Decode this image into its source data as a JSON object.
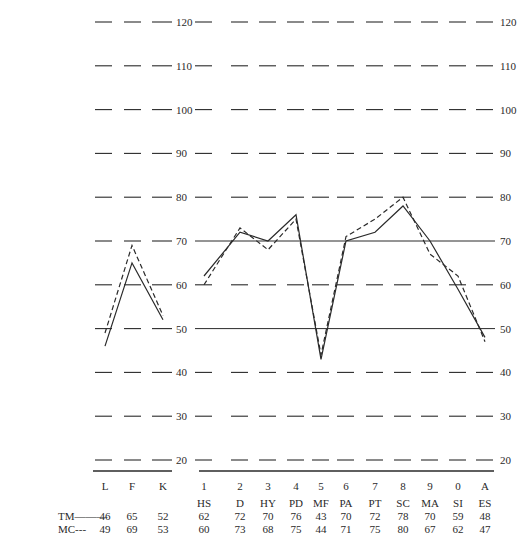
{
  "chart_data": {
    "type": "line",
    "title": "",
    "xlabel": "",
    "ylabel": "",
    "ylim": [
      20,
      120
    ],
    "y_ticks": [
      20,
      30,
      40,
      50,
      60,
      70,
      80,
      90,
      100,
      110,
      120
    ],
    "grid": "dashed horizontal, solid at 50 and 70 on clinical scales",
    "groups": [
      {
        "name": "validity",
        "categories": [
          "L",
          "F",
          "K"
        ],
        "series": [
          {
            "name": "TM",
            "style": "solid",
            "values": [
              46,
              65,
              52
            ]
          },
          {
            "name": "MC",
            "style": "dashed",
            "values": [
              49,
              69,
              53
            ]
          }
        ]
      },
      {
        "name": "clinical",
        "categories": [
          "1",
          "2",
          "3",
          "4",
          "5",
          "6",
          "7",
          "8",
          "9",
          "0",
          "A"
        ],
        "scale_names": [
          "HS",
          "D",
          "HY",
          "PD",
          "MF",
          "PA",
          "PT",
          "SC",
          "MA",
          "SI",
          "ES"
        ],
        "series": [
          {
            "name": "TM",
            "style": "solid",
            "values": [
              62,
              72,
              70,
              76,
              43,
              70,
              72,
              78,
              70,
              59,
              48
            ]
          },
          {
            "name": "MC",
            "style": "dashed",
            "values": [
              60,
              73,
              68,
              75,
              44,
              71,
              75,
              80,
              67,
              62,
              47
            ]
          }
        ]
      }
    ],
    "legend": [
      {
        "label": "TM———",
        "style": "solid"
      },
      {
        "label": "MC---",
        "style": "dashed"
      }
    ]
  },
  "table": {
    "legend_tm": "TM———",
    "legend_mc": "MC---",
    "left_cols": [
      {
        "tm": "46",
        "mc": "49"
      },
      {
        "tm": "65",
        "mc": "69"
      },
      {
        "tm": "52",
        "mc": "53"
      }
    ],
    "right_cols": [
      {
        "scale": "HS",
        "tm": "62",
        "mc": "60"
      },
      {
        "scale": "D",
        "tm": "72",
        "mc": "73"
      },
      {
        "scale": "HY",
        "tm": "70",
        "mc": "68"
      },
      {
        "scale": "PD",
        "tm": "76",
        "mc": "75"
      },
      {
        "scale": "MF",
        "tm": "43",
        "mc": "44"
      },
      {
        "scale": "PA",
        "tm": "70",
        "mc": "71"
      },
      {
        "scale": "PT",
        "tm": "72",
        "mc": "75"
      },
      {
        "scale": "SC",
        "tm": "78",
        "mc": "80"
      },
      {
        "scale": "MA",
        "tm": "70",
        "mc": "67"
      },
      {
        "scale": "SI",
        "tm": "59",
        "mc": "62"
      },
      {
        "scale": "ES",
        "tm": "48",
        "mc": "47"
      }
    ]
  },
  "colors": {
    "ink": "#2a2a2a",
    "background": "#ffffff"
  }
}
